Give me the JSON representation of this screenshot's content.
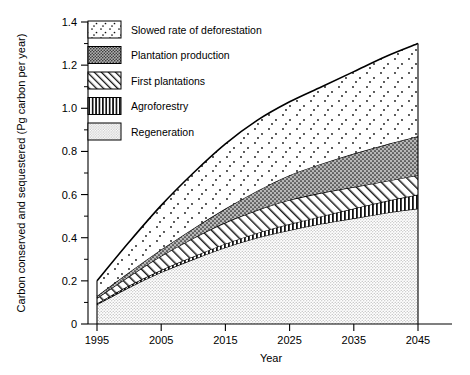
{
  "chart_data": {
    "type": "area",
    "stacked": true,
    "title": "",
    "xlabel": "Year",
    "ylabel": "Carbon conserved and sequestered (Pg carbon per year)",
    "xlim": [
      1995,
      2045
    ],
    "ylim": [
      0,
      1.4
    ],
    "xticks": [
      1995,
      2005,
      2015,
      2025,
      2035,
      2045
    ],
    "xtick_labels": [
      "1995",
      "2005",
      "2015",
      "2025",
      "2035",
      "2045"
    ],
    "yticks": [
      0,
      0.2,
      0.4,
      0.6,
      0.8,
      1.0,
      1.2,
      1.4
    ],
    "ytick_labels": [
      "0",
      "0.2",
      "0.4",
      "0.6",
      "0.8",
      "1.0",
      "1.2",
      "1.4"
    ],
    "yminor_ticks": [
      0.1,
      0.3,
      0.5,
      0.7,
      0.9,
      1.1,
      1.3
    ],
    "grid": false,
    "legend_position": "upper-left-inside",
    "x": [
      1995,
      2000,
      2005,
      2010,
      2015,
      2020,
      2025,
      2030,
      2035,
      2040,
      2045
    ],
    "series": [
      {
        "name": "Regeneration",
        "pattern": "fine-light-dots",
        "values": [
          0.09,
          0.17,
          0.24,
          0.3,
          0.355,
          0.4,
          0.435,
          0.465,
          0.49,
          0.515,
          0.535
        ],
        "cumulative": [
          0.09,
          0.17,
          0.24,
          0.3,
          0.355,
          0.4,
          0.435,
          0.465,
          0.49,
          0.515,
          0.535
        ]
      },
      {
        "name": "Agroforestry",
        "pattern": "vertical-lines",
        "values": [
          0.005,
          0.008,
          0.01,
          0.013,
          0.017,
          0.022,
          0.028,
          0.035,
          0.045,
          0.055,
          0.065
        ],
        "cumulative": [
          0.095,
          0.178,
          0.25,
          0.313,
          0.372,
          0.422,
          0.463,
          0.5,
          0.535,
          0.57,
          0.6
        ]
      },
      {
        "name": "First plantations",
        "pattern": "diagonal-hatch",
        "values": [
          0.025,
          0.042,
          0.065,
          0.085,
          0.098,
          0.106,
          0.112,
          0.108,
          0.1,
          0.092,
          0.09
        ],
        "cumulative": [
          0.12,
          0.22,
          0.315,
          0.398,
          0.47,
          0.528,
          0.575,
          0.608,
          0.635,
          0.662,
          0.69
        ]
      },
      {
        "name": "Plantation production",
        "pattern": "dense-dark-dots",
        "values": [
          0.01,
          0.02,
          0.03,
          0.045,
          0.065,
          0.09,
          0.115,
          0.135,
          0.155,
          0.17,
          0.18
        ],
        "cumulative": [
          0.13,
          0.24,
          0.345,
          0.443,
          0.535,
          0.618,
          0.69,
          0.743,
          0.79,
          0.832,
          0.87
        ]
      },
      {
        "name": "Slowed rate of deforestation",
        "pattern": "sparse-dots",
        "values": [
          0.07,
          0.14,
          0.205,
          0.257,
          0.3,
          0.327,
          0.34,
          0.357,
          0.38,
          0.408,
          0.43
        ],
        "cumulative": [
          0.2,
          0.38,
          0.55,
          0.7,
          0.835,
          0.945,
          1.03,
          1.1,
          1.17,
          1.24,
          1.3
        ]
      }
    ],
    "legend_entries": [
      {
        "label": "Slowed rate of deforestation",
        "pattern": "sparse-dots"
      },
      {
        "label": "Plantation production",
        "pattern": "dense-dark-dots"
      },
      {
        "label": "First plantations",
        "pattern": "diagonal-hatch"
      },
      {
        "label": "Agroforestry",
        "pattern": "vertical-lines"
      },
      {
        "label": "Regeneration",
        "pattern": "fine-light-dots"
      }
    ]
  },
  "axes": {
    "y_title": "Carbon conserved and sequestered (Pg carbon per year)",
    "x_title": "Year",
    "ytick_0": "0",
    "ytick_1": "0.2",
    "ytick_2": "0.4",
    "ytick_3": "0.6",
    "ytick_4": "0.8",
    "ytick_5": "1.0",
    "ytick_6": "1.2",
    "ytick_7": "1.4",
    "xtick_0": "1995",
    "xtick_1": "2005",
    "xtick_2": "2015",
    "xtick_3": "2025",
    "xtick_4": "2035",
    "xtick_5": "2045"
  },
  "legend": {
    "item_0": "Slowed rate of deforestation",
    "item_1": "Plantation production",
    "item_2": "First plantations",
    "item_3": "Agroforestry",
    "item_4": "Regeneration"
  }
}
